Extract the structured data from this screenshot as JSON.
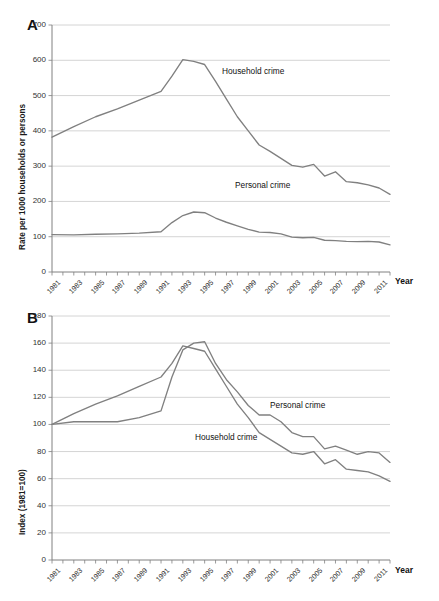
{
  "figure": {
    "background": "#ffffff",
    "line_color": "#808080",
    "grid_color": "#c9c9c9",
    "axis_color": "#808080",
    "text_color": "#1a1a1a"
  },
  "panels": [
    {
      "letter": "A",
      "xlabel": "Year",
      "series_labels": [
        {
          "text": "Household crime"
        },
        {
          "text": "Personal crime"
        }
      ]
    },
    {
      "letter": "B",
      "xlabel": "Year",
      "series_labels": [
        {
          "text": "Personal crime"
        },
        {
          "text": "Household crime"
        }
      ]
    }
  ],
  "chart_data": [
    {
      "type": "line",
      "panel": "A",
      "title": "",
      "xlabel": "Year",
      "ylabel": "Rate per 1000 households or persons",
      "ylim": [
        0,
        700
      ],
      "yticks": [
        0,
        100,
        200,
        300,
        400,
        500,
        600,
        700
      ],
      "ytick_labels": [
        "0",
        "100",
        "200",
        "300",
        "400",
        "500",
        "600",
        "700"
      ],
      "xlim": [
        1981,
        2012
      ],
      "xticks": [
        1981,
        1983,
        1985,
        1987,
        1989,
        1991,
        1993,
        1995,
        1997,
        1999,
        2001,
        2003,
        2005,
        2007,
        2009,
        2011
      ],
      "xtick_labels": [
        "1981",
        "1983",
        "1985",
        "1987",
        "1989",
        "1991",
        "1993",
        "1995",
        "1997",
        "1999",
        "2001",
        "2003",
        "2005",
        "2007",
        "2009",
        "2011"
      ],
      "grid": true,
      "legend_position": "inline-annotation",
      "x": [
        1981,
        1983,
        1985,
        1987,
        1989,
        1991,
        1992,
        1993,
        1994,
        1995,
        1996,
        1997,
        1998,
        1999,
        2000,
        2001,
        2002,
        2003,
        2004,
        2005,
        2006,
        2007,
        2008,
        2009,
        2010,
        2011,
        2012
      ],
      "series": [
        {
          "name": "Household crime",
          "values": [
            382,
            412,
            440,
            462,
            487,
            512,
            555,
            602,
            597,
            588,
            540,
            490,
            440,
            400,
            360,
            342,
            322,
            302,
            297,
            305,
            272,
            284,
            256,
            253,
            247,
            238,
            220
          ]
        },
        {
          "name": "Personal crime",
          "values": [
            106,
            105,
            107,
            108,
            110,
            114,
            140,
            160,
            170,
            168,
            153,
            141,
            131,
            121,
            113,
            112,
            108,
            99,
            97,
            98,
            90,
            89,
            87,
            86,
            87,
            85,
            77
          ]
        }
      ]
    },
    {
      "type": "line",
      "panel": "B",
      "title": "",
      "xlabel": "Year",
      "ylabel": "Index (1981=100)",
      "ylim": [
        0,
        180
      ],
      "yticks": [
        0,
        20,
        40,
        60,
        80,
        100,
        120,
        140,
        160,
        180
      ],
      "ytick_labels": [
        "0",
        "20",
        "40",
        "60",
        "80",
        "100",
        "120",
        "140",
        "160",
        "180"
      ],
      "xlim": [
        1981,
        2012
      ],
      "xticks": [
        1981,
        1983,
        1985,
        1987,
        1989,
        1991,
        1993,
        1995,
        1997,
        1999,
        2001,
        2003,
        2005,
        2007,
        2009,
        2011
      ],
      "xtick_labels": [
        "1981",
        "1983",
        "1985",
        "1987",
        "1989",
        "1991",
        "1993",
        "1995",
        "1997",
        "1999",
        "2001",
        "2003",
        "2005",
        "2007",
        "2009",
        "2011"
      ],
      "grid": true,
      "legend_position": "inline-annotation",
      "x": [
        1981,
        1983,
        1985,
        1987,
        1989,
        1991,
        1992,
        1993,
        1994,
        1995,
        1996,
        1997,
        1998,
        1999,
        2000,
        2001,
        2002,
        2003,
        2004,
        2005,
        2006,
        2007,
        2008,
        2009,
        2010,
        2011,
        2012
      ],
      "series": [
        {
          "name": "Household crime",
          "values": [
            100,
            108,
            115,
            121,
            128,
            135,
            145,
            158,
            156,
            154,
            141,
            128,
            115,
            105,
            94,
            89,
            84,
            79,
            78,
            80,
            71,
            74,
            67,
            66,
            65,
            62,
            58
          ]
        },
        {
          "name": "Personal crime",
          "values": [
            100,
            102,
            102,
            102,
            105,
            110,
            135,
            155,
            160,
            161,
            145,
            133,
            124,
            114,
            107,
            107,
            102,
            94,
            91,
            91,
            82,
            84,
            81,
            78,
            80,
            79,
            72
          ]
        }
      ]
    }
  ]
}
